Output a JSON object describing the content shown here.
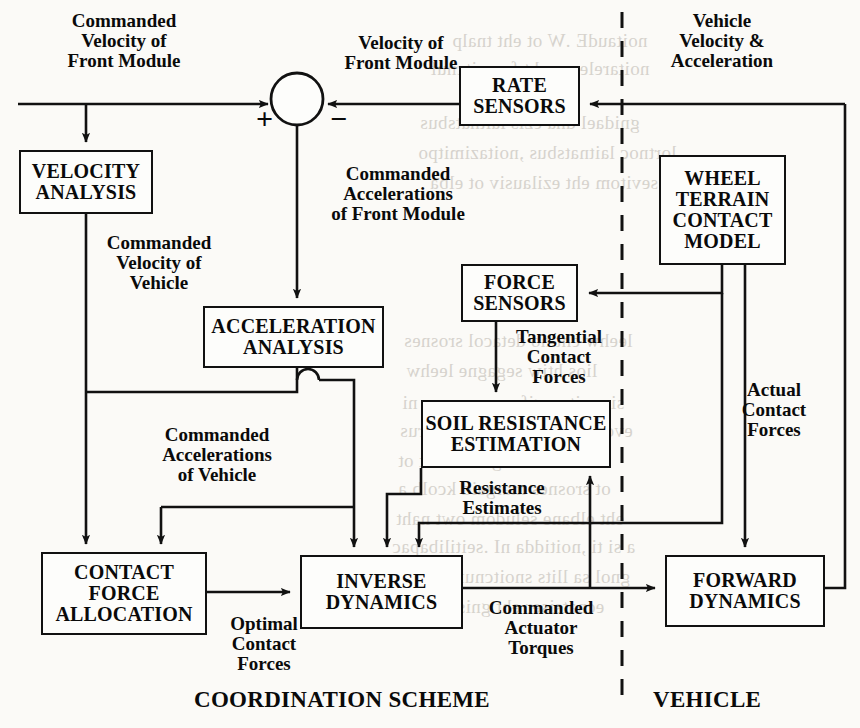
{
  "diagram": {
    "blocks": [
      {
        "id": "velocity_analysis",
        "label": "VELOCITY\nANALYSIS",
        "x": 19,
        "y": 150,
        "w": 134,
        "h": 64,
        "fs": 20
      },
      {
        "id": "acceleration_analysis",
        "label": "ACCELERATION\nANALYSIS",
        "x": 203,
        "y": 306,
        "w": 181,
        "h": 62,
        "fs": 20
      },
      {
        "id": "rate_sensors",
        "label": "RATE\nSENSORS",
        "x": 459,
        "y": 66,
        "w": 121,
        "h": 60,
        "fs": 20
      },
      {
        "id": "wheel_terrain_contact_model",
        "label": "WHEEL\nTERRAIN\nCONTACT\nMODEL",
        "x": 659,
        "y": 155,
        "w": 127,
        "h": 110,
        "fs": 20
      },
      {
        "id": "force_sensors",
        "label": "FORCE\nSENSORS",
        "x": 461,
        "y": 264,
        "w": 117,
        "h": 58,
        "fs": 20
      },
      {
        "id": "soil_resistance_estimation",
        "label": "SOIL RESISTANCE\nESTIMATION",
        "x": 421,
        "y": 400,
        "w": 190,
        "h": 68,
        "fs": 20
      },
      {
        "id": "contact_force_allocation",
        "label": "CONTACT\nFORCE\nALLOCATION",
        "x": 41,
        "y": 552,
        "w": 166,
        "h": 83,
        "fs": 20
      },
      {
        "id": "inverse_dynamics",
        "label": "INVERSE\nDYNAMICS",
        "x": 300,
        "y": 555,
        "w": 163,
        "h": 74,
        "fs": 20
      },
      {
        "id": "forward_dynamics",
        "label": "FORWARD\nDYNAMICS",
        "x": 665,
        "y": 555,
        "w": 160,
        "h": 72,
        "fs": 20
      }
    ],
    "signal_labels": [
      {
        "id": "commanded_velocity_front_module",
        "text": "Commanded\nVelocity of\nFront Module",
        "x": 26,
        "y": 11,
        "w": 196,
        "fs": 19
      },
      {
        "id": "velocity_of_front_module",
        "text": "Velocity of\nFront Module",
        "x": 316,
        "y": 33,
        "w": 170,
        "fs": 19
      },
      {
        "id": "vehicle_velocity_acceleration",
        "text": "Vehicle\nVelocity  &\nAcceleration",
        "x": 638,
        "y": 11,
        "w": 168,
        "fs": 19
      },
      {
        "id": "commanded_accelerations_front_module",
        "text": "Commanded\nAccelerations\nof Front Module",
        "x": 300,
        "y": 164,
        "w": 196,
        "fs": 19
      },
      {
        "id": "commanded_velocity_vehicle",
        "text": "Commanded\nVelocity of\nVehicle",
        "x": 81,
        "y": 233,
        "w": 156,
        "fs": 19
      },
      {
        "id": "commanded_accelerations_vehicle",
        "text": "Commanded\nAccelerations\nof Vehicle",
        "x": 131,
        "y": 425,
        "w": 172,
        "fs": 19
      },
      {
        "id": "tangential_contact_forces",
        "text": "Tangential\nContact\nForces",
        "x": 494,
        "y": 327,
        "w": 130,
        "fs": 19
      },
      {
        "id": "actual_contact_forces",
        "text": "Actual\nContact\nForces",
        "x": 722,
        "y": 380,
        "w": 104,
        "fs": 19
      },
      {
        "id": "resistance_estimates",
        "text": "Resistance\nEstimates",
        "x": 432,
        "y": 478,
        "w": 140,
        "fs": 19
      },
      {
        "id": "optimal_contact_forces",
        "text": "Optimal\nContact\nForces",
        "x": 216,
        "y": 614,
        "w": 96,
        "fs": 19
      },
      {
        "id": "commanded_actuator_torques",
        "text": "Commanded\nActuator\nTorques",
        "x": 467,
        "y": 598,
        "w": 148,
        "fs": 19
      }
    ],
    "summing_junction": {
      "id": "summing-junction",
      "cx": 297,
      "cy": 99,
      "r": 26,
      "plus_sign": "+",
      "minus_sign": "−",
      "plus_x": 256,
      "plus_y": 104,
      "minus_x": 330,
      "minus_y": 104
    },
    "zone_labels": [
      {
        "id": "coordination_scheme",
        "text": "COORDINATION SCHEME",
        "x": 194,
        "y": 687,
        "fs": 23
      },
      {
        "id": "vehicle",
        "text": "VEHICLE",
        "x": 653,
        "y": 687,
        "fs": 23
      }
    ],
    "divider": {
      "id": "coordination-vehicle-divider",
      "x": 622,
      "y1": 12,
      "y2": 703,
      "style": "dashed"
    },
    "colors": {
      "ink": "#111111",
      "paper": "#fbfaf7",
      "ghost": "#b9b4ac"
    },
    "bleed_through": [
      {
        "t": "noitaudE .W ot eht tnalp",
        "x": 452,
        "y": 30
      },
      {
        "t": "noitarelecca eht fo noitcnuf",
        "x": 430,
        "y": 58
      },
      {
        "t": "gnidael dna ezis laitnatsbus",
        "x": 420,
        "y": 112
      },
      {
        "t": "lortnoc laitnatsbus ,noitazimitpo",
        "x": 418,
        "y": 142
      },
      {
        "t": "sevitom eht ezilausiv ot elba",
        "x": 430,
        "y": 172
      },
      {
        "t": "leehw eht no detacol srosnes",
        "x": 404,
        "y": 330
      },
      {
        "t": "lios htiw segagne leehw",
        "x": 406,
        "y": 360
      },
      {
        "t": "si ,noitarugifnoc ereves a ni",
        "x": 402,
        "y": 392
      },
      {
        "t": "evorp ehT .ecnatsiser ecafrus",
        "x": 400,
        "y": 420
      },
      {
        "t": "decudsnart gnillor eht ot",
        "x": 398,
        "y": 450
      },
      {
        "t": "ot srosnes margaid kcolb a",
        "x": 398,
        "y": 478
      },
      {
        "t": "eht elbane seludom owt naht",
        "x": 396,
        "y": 508
      },
      {
        "t": "a si ti ,noitidda nI .seitilibapac",
        "x": 392,
        "y": 536
      },
      {
        "t": "gnol sa llits snoitcnuf esrevda",
        "x": 392,
        "y": 566
      },
      {
        "t": "ecnatsiser eht gnisaercni si",
        "x": 390,
        "y": 596
      }
    ]
  }
}
